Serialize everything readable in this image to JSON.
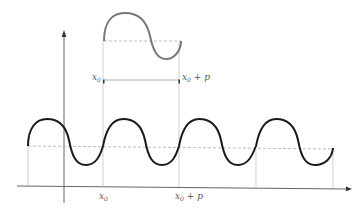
{
  "diagram": {
    "labels": {
      "x0_axis": "x",
      "x0_axis_sub": "0",
      "x0p_axis": "x",
      "x0p_axis_sub": "0",
      "x0p_axis_suffix": " + p",
      "x0_inset": "x",
      "x0_inset_sub": "0",
      "x0p_inset": "x",
      "x0p_inset_sub": "0",
      "x0p_inset_suffix": " + p"
    },
    "colors": {
      "main_wave": "#1a1a1a",
      "inset_wave": "#777777",
      "axes": "#555555",
      "guides": "#bbbbbb",
      "dashed": "#aaaaaa"
    },
    "geometry": {
      "x0": 103,
      "x0_plus_p": 179,
      "period_px": 76,
      "baseline_y": 146,
      "peak_y": 119,
      "trough_y": 165
    }
  }
}
